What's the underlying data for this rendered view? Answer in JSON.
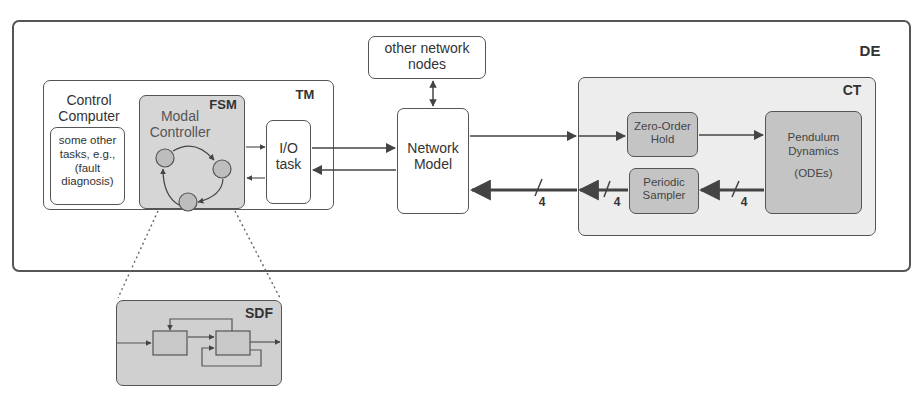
{
  "diagram": {
    "de": {
      "label": "DE"
    },
    "other_nodes": {
      "label_line1": "other network",
      "label_line2": "nodes"
    },
    "tm": {
      "label": "TM"
    },
    "control_computer": {
      "label_line1": "Control",
      "label_line2": "Computer"
    },
    "other_tasks": {
      "line1": "some other",
      "line2": "tasks, e.g.,",
      "line3": "(fault",
      "line4": "diagnosis)"
    },
    "fsm": {
      "label": "FSM",
      "title_line1": "Modal",
      "title_line2": "Controller"
    },
    "io_task": {
      "line1": "I/O",
      "line2": "task"
    },
    "network_model": {
      "line1": "Network",
      "line2": "Model"
    },
    "ct": {
      "label": "CT"
    },
    "zoh": {
      "line1": "Zero-Order",
      "line2": "Hold"
    },
    "sampler": {
      "line1": "Periodic",
      "line2": "Sampler"
    },
    "pendulum": {
      "line1": "Pendulum",
      "line2": "Dynamics",
      "line3": "(ODEs)"
    },
    "bus_widths": [
      "4",
      "4",
      "4"
    ],
    "sdf": {
      "label": "SDF"
    }
  },
  "colors": {
    "stroke": "#555555",
    "fsm_fill": "#d6d6d6",
    "ct_fill": "#ededed",
    "block_fill": "#c4c4c4",
    "state_fill": "#bdbdbd",
    "sdf_fill": "#d0d0d0"
  }
}
